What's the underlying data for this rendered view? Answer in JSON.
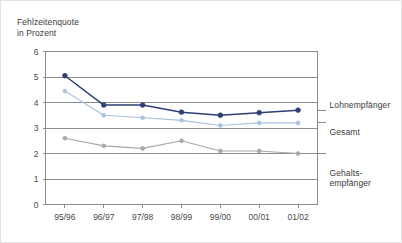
{
  "chart_data": {
    "type": "line",
    "title_line1": "Fehlzeitenquote",
    "title_line2": "in Prozent",
    "xlabel": "",
    "ylabel": "Fehlzeitenquote in Prozent",
    "ylim": [
      0,
      6
    ],
    "yticks": [
      0,
      1,
      2,
      3,
      4,
      5,
      6
    ],
    "ytick_labels": [
      "0",
      "1",
      "2",
      "3",
      "4",
      "5",
      "6"
    ],
    "grid": true,
    "grid_axis": "y",
    "legend_position": "right-inline",
    "categories": [
      "95/96",
      "96/97",
      "97/98",
      "98/99",
      "99/00",
      "00/01",
      "01/02"
    ],
    "series": [
      {
        "name": "Lohnempfänger",
        "color": "#2d3f73",
        "marker": "circle",
        "values": [
          5.05,
          3.9,
          3.9,
          3.62,
          3.5,
          3.6,
          3.7
        ]
      },
      {
        "name": "Gesamt",
        "color": "#a9c3dd",
        "marker": "circle",
        "values": [
          4.45,
          3.5,
          3.4,
          3.3,
          3.1,
          3.2,
          3.2
        ]
      },
      {
        "name": "Gehalts-\nempfänger",
        "color": "#a8a8a8",
        "marker": "circle",
        "values": [
          2.6,
          2.3,
          2.2,
          2.5,
          2.1,
          2.1,
          2.0
        ]
      }
    ]
  },
  "legend": {
    "item1": "Lohnempfänger",
    "item2": "Gesamt",
    "item3": "Gehalts-\nempfänger"
  },
  "colors": {
    "series_dark_blue": "#2d3f73",
    "series_light_blue": "#a9c3dd",
    "series_gray": "#a8a8a8",
    "grid": "#8c8c8c",
    "axis": "#8c8c8c",
    "text": "#3a3a3a",
    "frame": "#e2e2e2",
    "background": "#ffffff"
  }
}
